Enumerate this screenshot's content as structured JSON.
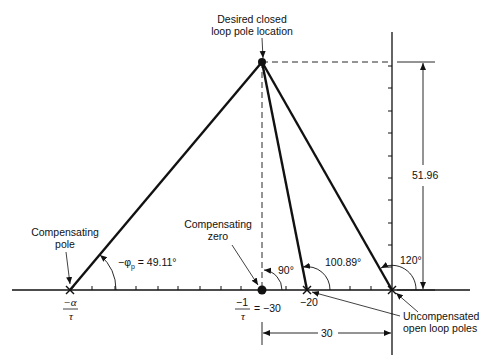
{
  "diagram": {
    "type": "root-locus-angle-construction",
    "labels": {
      "desired_pole_line1": "Desired closed",
      "desired_pole_line2": "loop pole location",
      "comp_pole_line1": "Compensating",
      "comp_pole_line2": "pole",
      "comp_zero_line1": "Compensating",
      "comp_zero_line2": "zero",
      "uncomp_line1": "Uncompensated",
      "uncomp_line2": "open loop poles",
      "phi_label": "−φ",
      "phi_sub": "p",
      "phi_value": " = 49.11°",
      "angle_zero": "90°",
      "angle_pole20": "100.89°",
      "angle_pole0": "120°",
      "height_dim": "51.96",
      "width_dim": "30",
      "alpha_num": "−α",
      "alpha_den": "τ",
      "zero_num": "−1",
      "zero_den": "τ",
      "zero_eq": "= −30",
      "pole20_tick": "−20"
    },
    "points": {
      "desired_pole": {
        "re": -30,
        "im": 51.96
      },
      "compensating_zero": {
        "re": -30,
        "im": 0
      },
      "uncompensated_poles": [
        {
          "re": -20,
          "im": 0
        },
        {
          "re": 0,
          "im": 0
        }
      ],
      "compensating_pole": {
        "re": "-α/τ",
        "im": 0
      }
    },
    "angles_deg": {
      "compensating_pole": 49.11,
      "compensating_zero": 90,
      "pole_minus20": 100.89,
      "pole_origin": 120
    }
  }
}
